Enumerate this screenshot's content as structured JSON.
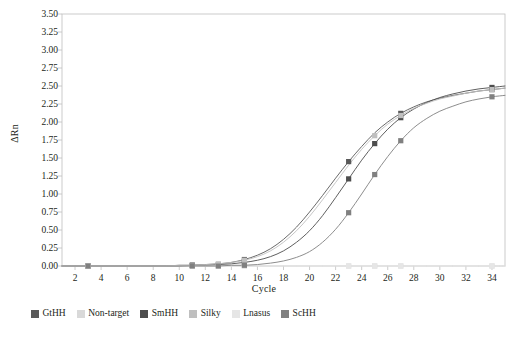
{
  "chart_data": {
    "type": "line",
    "title": "",
    "xlabel": "Cycle",
    "ylabel": "ΔRn",
    "xlim": [
      1,
      35
    ],
    "ylim": [
      0.0,
      3.5
    ],
    "grid": false,
    "legend_position": "bottom",
    "x_ticks": [
      "2",
      "4",
      "6",
      "8",
      "10",
      "12",
      "14",
      "16",
      "18",
      "20",
      "22",
      "24",
      "26",
      "28",
      "30",
      "32",
      "34"
    ],
    "y_ticks": [
      "0.00",
      "0.25",
      "0.50",
      "0.75",
      "1.00",
      "1.25",
      "1.50",
      "1.75",
      "2.00",
      "2.25",
      "2.50",
      "2.75",
      "3.00",
      "3.25",
      "3.50"
    ],
    "x": [
      1,
      2,
      3,
      4,
      5,
      6,
      7,
      8,
      9,
      10,
      11,
      12,
      13,
      14,
      15,
      16,
      17,
      18,
      19,
      20,
      21,
      22,
      23,
      24,
      25,
      26,
      27,
      28,
      29,
      30,
      31,
      32,
      33,
      34,
      35
    ],
    "series": [
      {
        "name": "GtHH",
        "color": "#595959",
        "marker_cycles": [
          3,
          11,
          15,
          23,
          27,
          34
        ],
        "values": [
          0.0,
          0.0,
          0.0,
          0.0,
          0.0,
          0.0,
          0.0,
          0.0,
          0.0,
          0.01,
          0.01,
          0.02,
          0.03,
          0.05,
          0.09,
          0.15,
          0.24,
          0.37,
          0.54,
          0.75,
          0.98,
          1.22,
          1.45,
          1.66,
          1.85,
          2.0,
          2.12,
          2.21,
          2.28,
          2.33,
          2.37,
          2.4,
          2.43,
          2.45,
          2.47
        ]
      },
      {
        "name": "Non-target",
        "color": "#d9d9d9",
        "marker_cycles": [
          3,
          11,
          13,
          15,
          23,
          25,
          27,
          34
        ],
        "values": [
          0.0,
          0.0,
          0.0,
          0.0,
          0.0,
          0.0,
          0.0,
          0.0,
          0.0,
          0.0,
          0.0,
          0.0,
          0.0,
          0.0,
          0.0,
          0.0,
          0.0,
          0.0,
          0.0,
          0.0,
          0.0,
          0.0,
          0.0,
          0.0,
          0.0,
          0.0,
          0.0,
          0.0,
          0.0,
          0.0,
          0.0,
          0.0,
          0.0,
          0.0,
          0.0
        ]
      },
      {
        "name": "SmHH",
        "color": "#4d4d4d",
        "marker_cycles": [
          3,
          11,
          13,
          15,
          23,
          25,
          27,
          34
        ],
        "values": [
          0.0,
          0.0,
          0.0,
          0.0,
          0.0,
          0.0,
          0.0,
          0.0,
          0.0,
          0.0,
          0.01,
          0.01,
          0.02,
          0.03,
          0.05,
          0.08,
          0.13,
          0.21,
          0.33,
          0.49,
          0.7,
          0.95,
          1.21,
          1.47,
          1.7,
          1.9,
          2.06,
          2.18,
          2.27,
          2.34,
          2.39,
          2.43,
          2.46,
          2.48,
          2.5
        ]
      },
      {
        "name": "Silky",
        "color": "#bfbfbf",
        "marker_cycles": [
          3,
          13,
          15,
          25,
          27,
          34
        ],
        "values": [
          0.0,
          0.0,
          0.0,
          0.0,
          0.0,
          0.0,
          0.0,
          0.0,
          0.0,
          0.01,
          0.01,
          0.02,
          0.03,
          0.05,
          0.08,
          0.13,
          0.21,
          0.33,
          0.49,
          0.69,
          0.92,
          1.16,
          1.4,
          1.62,
          1.81,
          1.97,
          2.09,
          2.19,
          2.26,
          2.32,
          2.36,
          2.4,
          2.43,
          2.45,
          2.47
        ]
      },
      {
        "name": "Lnasus",
        "color": "#e6e6e6",
        "marker_cycles": [
          3,
          11,
          13,
          15,
          23,
          25,
          27,
          34
        ],
        "values": [
          0.0,
          0.0,
          0.0,
          0.0,
          0.0,
          0.0,
          0.0,
          0.0,
          0.0,
          0.0,
          0.0,
          0.0,
          0.0,
          0.0,
          0.0,
          0.0,
          0.0,
          0.0,
          0.0,
          0.0,
          0.0,
          0.0,
          0.0,
          0.0,
          0.0,
          0.0,
          0.0,
          0.0,
          0.0,
          0.0,
          0.0,
          0.0,
          0.0,
          0.0,
          0.0
        ]
      },
      {
        "name": "ScHH",
        "color": "#808080",
        "marker_cycles": [
          3,
          11,
          13,
          15,
          23,
          25,
          27,
          34
        ],
        "values": [
          0.0,
          0.0,
          0.0,
          0.0,
          0.0,
          0.0,
          0.0,
          0.0,
          0.0,
          0.0,
          0.0,
          0.0,
          0.0,
          0.01,
          0.01,
          0.02,
          0.04,
          0.07,
          0.12,
          0.2,
          0.33,
          0.51,
          0.74,
          1.0,
          1.27,
          1.52,
          1.74,
          1.92,
          2.05,
          2.15,
          2.22,
          2.28,
          2.32,
          2.35,
          2.37
        ]
      }
    ]
  },
  "legend": {
    "items": [
      {
        "label": "GtHH",
        "color": "#595959"
      },
      {
        "label": "Non-target",
        "color": "#d9d9d9"
      },
      {
        "label": "SmHH",
        "color": "#4d4d4d"
      },
      {
        "label": "Silky",
        "color": "#bfbfbf"
      },
      {
        "label": "Lnasus",
        "color": "#e6e6e6"
      },
      {
        "label": "ScHH",
        "color": "#808080"
      }
    ]
  },
  "axes": {
    "frame_color": "#bfbfbf",
    "text_color": "#231f20"
  }
}
